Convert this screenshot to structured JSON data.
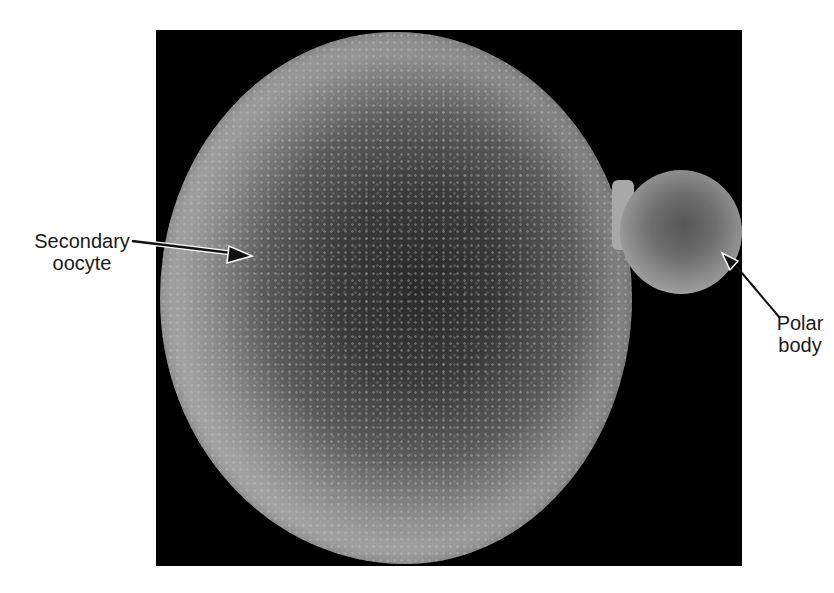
{
  "figure": {
    "type": "scanning electron micrograph",
    "background_color": "#000000"
  },
  "labels": {
    "secondary_oocyte": {
      "line1": "Secondary",
      "line2": "oocyte"
    },
    "polar_body": {
      "line1": "Polar",
      "line2": "body"
    }
  }
}
